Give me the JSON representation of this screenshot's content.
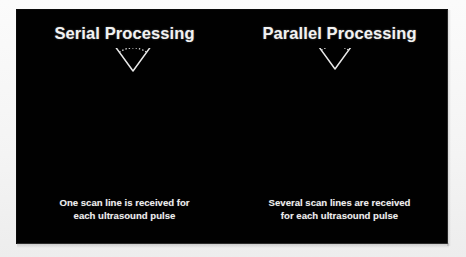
{
  "slide": {
    "background_color": "#010101",
    "page_background_color": "#fdfdfd",
    "line_color": "#e8e8e8",
    "text_color": "#f2f2f2"
  },
  "panels": [
    {
      "id": "serial",
      "title": "Serial Processing",
      "caption_line1": "One scan line is received for",
      "caption_line2": "each ultrasound pulse",
      "scan_line_count": 1,
      "arc_count": 15,
      "sector": {
        "apex_x": 116,
        "apex_y": 23,
        "radius_outer": 127,
        "radius_inner": 16,
        "half_angle_deg": 36
      },
      "scan_line_angles_deg": [
        -7
      ]
    },
    {
      "id": "parallel",
      "title": "Parallel Processing",
      "caption_line1": "Several scan lines are received",
      "caption_line2": "for each ultrasound pulse",
      "scan_line_count": 4,
      "arc_count": 15,
      "sector": {
        "apex_x": 103,
        "apex_y": 21,
        "radius_outer": 127,
        "radius_inner": 16,
        "half_angle_deg": 36
      },
      "scan_line_angles_deg": [
        -12,
        -4,
        4,
        12
      ]
    }
  ]
}
